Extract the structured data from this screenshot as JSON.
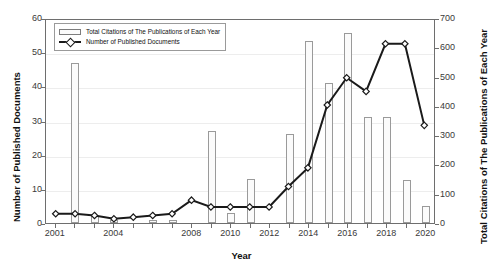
{
  "chart_data": {
    "type": "bar",
    "title": "",
    "xlabel": "Year",
    "ylabel": "Number of Published Documents",
    "y2label": "Total Citations of The Publications of Each Year",
    "grid": true,
    "legend_position": "top-left",
    "ylim": [
      0,
      60
    ],
    "y2lim": [
      0,
      700
    ],
    "yticks": [
      0,
      10,
      20,
      30,
      40,
      50,
      60
    ],
    "y2ticks": [
      0,
      100,
      200,
      300,
      400,
      500,
      600,
      700
    ],
    "categories": [
      2001,
      2002,
      2003,
      2004,
      2005,
      2006,
      2007,
      2008,
      2009,
      2010,
      2011,
      2012,
      2013,
      2014,
      2015,
      2016,
      2017,
      2018,
      2019,
      2020
    ],
    "xticklabels": [
      "2001",
      "2004",
      "2008",
      "2010",
      "2012",
      "2014",
      "2016",
      "2018",
      "2020"
    ],
    "series": [
      {
        "name": "Total Citations of The Publications of Each Year",
        "kind": "bar",
        "axis": "right",
        "values": [
          0,
          548,
          23,
          12,
          0,
          12,
          12,
          0,
          315,
          35,
          152,
          0,
          303,
          622,
          478,
          650,
          362,
          362,
          146,
          58
        ]
      },
      {
        "name": "Number of Published Documents",
        "kind": "line",
        "axis": "left",
        "marker": "diamond",
        "values": [
          3,
          3,
          2.5,
          1.5,
          2,
          2.5,
          3,
          7,
          5,
          5,
          5,
          5,
          11,
          16.5,
          35,
          43,
          39,
          53,
          53,
          29
        ]
      }
    ]
  },
  "legend": {
    "items": [
      {
        "label": "Total Citations of The Publications of Each Year",
        "swatch": "bar-swatch"
      },
      {
        "label": "Number of Published Documents",
        "swatch": "line-swatch"
      }
    ]
  },
  "axes": {
    "left_title": "Number of Published Documents",
    "right_title": "Total Citations of The Publications of Each Year",
    "x_title": "Year"
  }
}
